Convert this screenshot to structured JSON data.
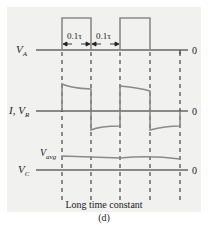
{
  "figure": {
    "caption": "(d)",
    "subtitle": "Long time constant",
    "colors": {
      "panel": "#f1f1f0",
      "axis": "#222222",
      "waveform": "#8a8a8a"
    }
  },
  "traces": [
    {
      "id": "va",
      "label_main": "V",
      "label_sub": "A",
      "zero_label": "0"
    },
    {
      "id": "ir",
      "label_main": "I, V",
      "label_sub": "R",
      "zero_label": "0"
    },
    {
      "id": "vc",
      "label_main": "V",
      "label_sub": "C",
      "zero_label": "0"
    }
  ],
  "annotations": {
    "pulse_width": "0.1τ",
    "gap_width": "0.1τ",
    "vavg_main": "V",
    "vavg_sub": "avg"
  }
}
